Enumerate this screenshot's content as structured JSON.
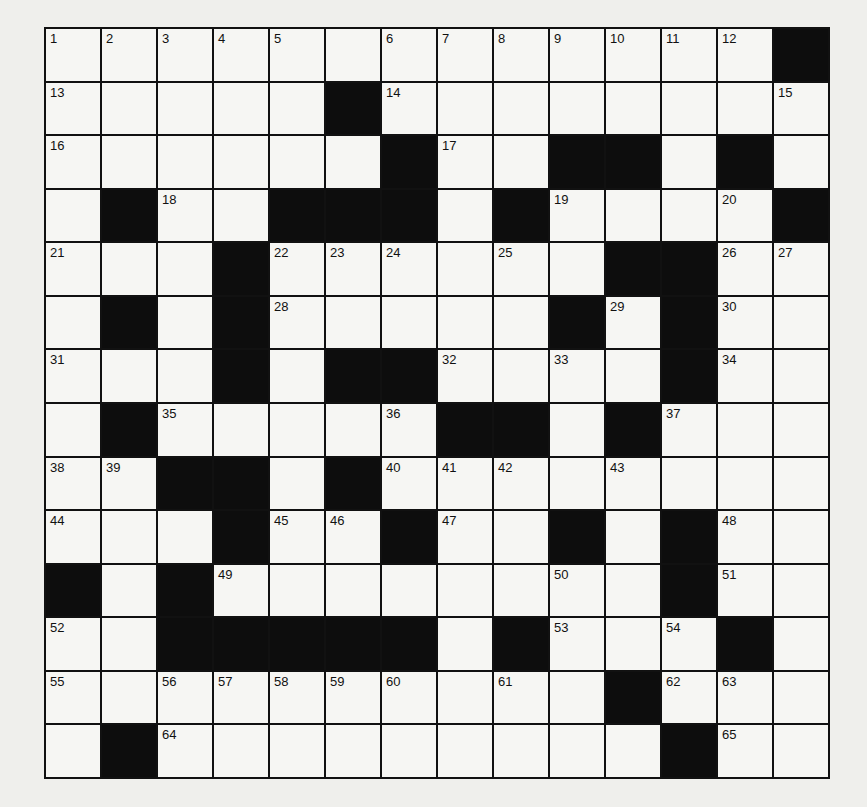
{
  "puzzle": {
    "rows": 14,
    "cols": 14,
    "grid": [
      [
        "1",
        "2",
        "3",
        "4",
        "5",
        "",
        "6",
        "7",
        "8",
        "9",
        "10",
        "11",
        "12",
        "#"
      ],
      [
        "13",
        "",
        "",
        "",
        "",
        "#",
        "14",
        "",
        "",
        "",
        "",
        "",
        "",
        "15"
      ],
      [
        "16",
        "",
        "",
        "",
        "",
        "",
        "#",
        "17",
        "",
        "#",
        "#",
        "",
        "#",
        ""
      ],
      [
        "",
        "#",
        "18",
        "",
        "#",
        "#",
        "#",
        "",
        "#",
        "19",
        "",
        "",
        "20",
        "#"
      ],
      [
        "21",
        "",
        "",
        "#",
        "22",
        "23",
        "24",
        "",
        "25",
        "",
        "#",
        "#",
        "26",
        "27"
      ],
      [
        "",
        "#",
        "",
        "#",
        "28",
        "",
        "",
        "",
        "",
        "#",
        "29",
        "#",
        "30",
        ""
      ],
      [
        "31",
        "",
        "",
        "#",
        "",
        "#",
        "#",
        "32",
        "",
        "33",
        "",
        "#",
        "34",
        ""
      ],
      [
        "",
        "#",
        "35",
        "",
        "",
        "",
        "36",
        "#",
        "#",
        "",
        "#",
        "37",
        "",
        ""
      ],
      [
        "38",
        "39",
        "#",
        "#",
        "",
        "#",
        "40",
        "41",
        "42",
        "",
        "43",
        "",
        "",
        ""
      ],
      [
        "44",
        "",
        "",
        "#",
        "45",
        "46",
        "#",
        "47",
        "",
        "#",
        "",
        "#",
        "48",
        ""
      ],
      [
        "#",
        "",
        "#",
        "49",
        "",
        "",
        "",
        "",
        "",
        "50",
        "",
        "#",
        "51",
        ""
      ],
      [
        "52",
        "",
        "#",
        "#",
        "#",
        "#",
        "#",
        "",
        "#",
        "53",
        "",
        "54",
        "#",
        ""
      ],
      [
        "55",
        "",
        "56",
        "57",
        "58",
        "59",
        "60",
        "",
        "61",
        "",
        "#",
        "62",
        "63",
        ""
      ],
      [
        "",
        "#",
        "64",
        "",
        "",
        "",
        "",
        "",
        "",
        "",
        "",
        "#",
        "65",
        ""
      ]
    ]
  }
}
